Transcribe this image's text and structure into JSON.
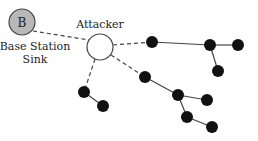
{
  "diagram": {
    "base_station": {
      "letter": "B",
      "label_line1": "Base Station",
      "label_line2": "Sink",
      "fill": "#b8b8b8"
    },
    "attacker": {
      "label": "Attacker"
    },
    "node_color": "#111111"
  }
}
